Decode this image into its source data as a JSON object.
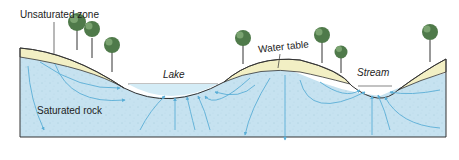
{
  "diagram": {
    "type": "groundwater-cross-section",
    "labels": {
      "unsaturated_zone": "Unsaturated zone",
      "water_table": "Water table",
      "lake": "Lake",
      "stream": "Stream",
      "saturated_rock": "Saturated rock"
    },
    "colors": {
      "saturated": "#c6e2f0",
      "unsaturated": "#f2efc4",
      "flow_arrows": "#5aaed6",
      "outline": "#333333",
      "tree_foliage": "#4f7a4a"
    },
    "trees": [
      {
        "x": 77,
        "y": 12
      },
      {
        "x": 93,
        "y": 18
      },
      {
        "x": 112,
        "y": 24
      },
      {
        "x": 243,
        "y": 30
      },
      {
        "x": 320,
        "y": 28
      },
      {
        "x": 342,
        "y": 47
      },
      {
        "x": 429,
        "y": 26
      }
    ]
  }
}
